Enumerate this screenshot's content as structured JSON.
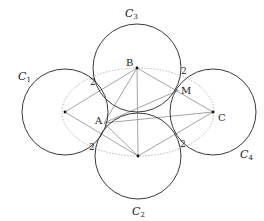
{
  "diagram": {
    "circles": [
      {
        "id": "C1",
        "label": "C",
        "sub": "1",
        "cx": 65,
        "cy": 112,
        "r": 43,
        "lx": 18,
        "ly": 80
      },
      {
        "id": "C2",
        "label": "C",
        "sub": "2",
        "cx": 138,
        "cy": 156,
        "r": 43,
        "lx": 132,
        "ly": 215
      },
      {
        "id": "C3",
        "label": "C",
        "sub": "3",
        "cx": 137,
        "cy": 68,
        "r": 44,
        "lx": 125,
        "ly": 17
      },
      {
        "id": "C4",
        "label": "C",
        "sub": "4",
        "cx": 213,
        "cy": 112,
        "r": 43,
        "lx": 240,
        "ly": 158
      }
    ],
    "points": [
      {
        "name": "B",
        "label": "B",
        "x": 137,
        "y": 68,
        "lx": 126,
        "ly": 66
      },
      {
        "name": "C",
        "label": "C",
        "x": 213,
        "y": 112,
        "lx": 218,
        "ly": 121
      },
      {
        "name": "A",
        "label": "A",
        "x": 104,
        "y": 123,
        "lx": 95,
        "ly": 124
      },
      {
        "name": "M",
        "label": "M",
        "x": 179,
        "y": 90,
        "lx": 181,
        "ly": 94
      },
      {
        "name": "O1",
        "label": "",
        "x": 65,
        "y": 112
      },
      {
        "name": "O2",
        "label": "",
        "x": 138,
        "y": 156
      }
    ],
    "tangent_labels": [
      {
        "text": "2",
        "x": 90,
        "y": 85
      },
      {
        "text": "2",
        "x": 181,
        "y": 74
      },
      {
        "text": "2",
        "x": 89,
        "y": 150
      },
      {
        "text": "2",
        "x": 180,
        "y": 147
      }
    ],
    "ellipse": {
      "cx": 138,
      "cy": 112,
      "rx": 76,
      "ry": 44
    }
  }
}
